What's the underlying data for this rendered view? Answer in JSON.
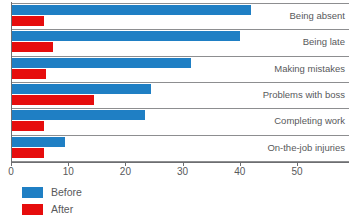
{
  "chart_data": {
    "type": "bar",
    "orientation": "horizontal",
    "title": "",
    "subtitle": "",
    "xlabel": "",
    "ylabel": "",
    "xlim": [
      0,
      59
    ],
    "grid": false,
    "legend_position": "bottom-left",
    "xticks": [
      0,
      10,
      20,
      30,
      40,
      50
    ],
    "xtick_labels": [
      "0",
      "10",
      "20",
      "30",
      "40",
      "50"
    ],
    "categories": [
      "Being absent",
      "Being late",
      "Making mistakes",
      "Problems with boss",
      "Completing work",
      "On-the-job injuries"
    ],
    "series": [
      {
        "name": "Before",
        "color": "#1f7fc4",
        "values": [
          42,
          40,
          31.5,
          24.5,
          23.5,
          9.5
        ]
      },
      {
        "name": "After",
        "color": "#e60d0d",
        "values": [
          5.8,
          7.3,
          6.1,
          14.5,
          5.8,
          5.8
        ]
      }
    ]
  },
  "legend": {
    "items": [
      {
        "label": "Before",
        "color": "#1f7fc4"
      },
      {
        "label": "After",
        "color": "#e60d0d"
      }
    ]
  },
  "colors": {
    "before": "#1f7fc4",
    "after": "#e60d0d",
    "axis": "#6d6e71",
    "separator": "#8d8e90",
    "text": "#58595b",
    "background": "#ffffff"
  }
}
